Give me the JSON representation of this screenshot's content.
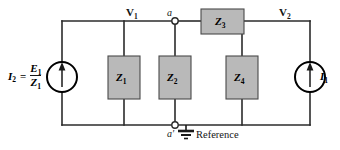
{
  "figure": {
    "name": "two-node ac circuit with current sources and impedances",
    "background": "#ffffff",
    "wire_color": "#2b2b2b",
    "box_fill": "#b9b9b9",
    "box_border": "#4a4a4a"
  },
  "sources": {
    "left": {
      "name": "I2",
      "label_current": "I",
      "label_current_sub": "2",
      "equals": "=",
      "numerator": "E",
      "numerator_sub": "1",
      "denominator": "Z",
      "denominator_sub": "1",
      "arrow_direction": "up",
      "symbol": "current-source-circle"
    },
    "right": {
      "name": "I1",
      "label_current": "I",
      "label_current_sub": "1",
      "arrow_direction": "up",
      "symbol": "current-source-circle"
    }
  },
  "impedances": [
    {
      "id": "Z1",
      "letter": "Z",
      "subscript": "1",
      "orientation": "vertical"
    },
    {
      "id": "Z2",
      "letter": "Z",
      "subscript": "2",
      "orientation": "vertical"
    },
    {
      "id": "Z3",
      "letter": "Z",
      "subscript": "3",
      "orientation": "horizontal"
    },
    {
      "id": "Z4",
      "letter": "Z",
      "subscript": "4",
      "orientation": "vertical"
    }
  ],
  "nodes": {
    "v1": {
      "letter": "V",
      "subscript": "1"
    },
    "v2": {
      "letter": "V",
      "subscript": "2"
    },
    "a": {
      "label": "a"
    },
    "a_prime": {
      "label": "a",
      "prime": "′"
    }
  },
  "ground": {
    "label": "Reference",
    "symbol": "ground-symbol"
  }
}
